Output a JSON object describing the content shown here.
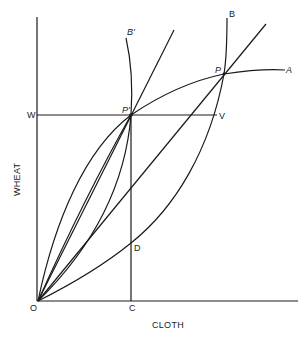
{
  "diagram": {
    "axes": {
      "x_label": "CLOTH",
      "y_label": "WHEAT",
      "origin_label": "O"
    },
    "points": {
      "P": "P",
      "P_prime": "P'",
      "W": "W",
      "V": "V",
      "C": "C",
      "D": "D"
    },
    "curves": {
      "A": "A",
      "B": "B",
      "B_prime": "B'"
    },
    "line_color": "#1a1a1a"
  }
}
